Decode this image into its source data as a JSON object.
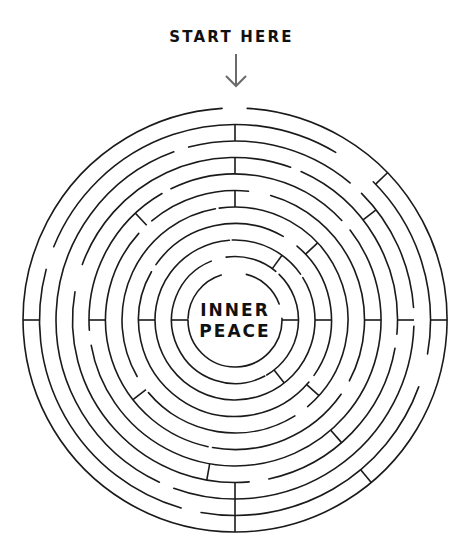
{
  "header": {
    "start_label": "START HERE",
    "arrow_icon": "arrow-down-icon"
  },
  "center": {
    "line1": "INNER",
    "line2": "PEACE"
  },
  "maze": {
    "center": [
      235,
      320
    ],
    "stroke_color": "#1a1a1a",
    "arrow_color": "#6b6b6b",
    "stroke_width": 1.6,
    "radii": [
      47,
      63.5,
      80,
      96.5,
      113,
      129.5,
      146,
      162.5,
      179,
      195.5,
      212
    ],
    "gaps": [
      [
        [
          -17,
          14
        ],
        [
          70,
          88
        ],
        [
          270,
          272
        ]
      ],
      [
        [
          -22,
          -8
        ],
        [
          40,
          44
        ],
        [
          150,
          152
        ]
      ],
      [
        [
          55,
          58
        ],
        [
          -4,
          -2
        ]
      ],
      [
        [
          30,
          40
        ],
        [
          125,
          130
        ],
        [
          -60,
          -55
        ]
      ],
      [
        [
          -10,
          -8
        ],
        [
          140,
          148
        ],
        [
          230,
          240
        ]
      ],
      [
        [
          6,
          16
        ],
        [
          118,
          125
        ],
        [
          -48,
          -40
        ],
        [
          190,
          192
        ]
      ],
      [
        [
          47,
          52
        ],
        [
          -30,
          -26
        ],
        [
          260,
          266
        ]
      ],
      [
        [
          20,
          24
        ],
        [
          95,
          100
        ],
        [
          -80,
          -70
        ],
        [
          168,
          175
        ]
      ],
      [
        [
          40,
          45
        ],
        [
          86,
          92
        ],
        [
          200,
          205
        ],
        [
          -20,
          -15
        ]
      ],
      [
        [
          31,
          45
        ],
        [
          100,
          110
        ],
        [
          190,
          196
        ],
        [
          -75,
          -68
        ]
      ],
      [
        [
          -3.5,
          3.3
        ]
      ]
    ],
    "walls": [
      [
        0,
        8,
        9
      ],
      [
        0,
        6,
        7
      ],
      [
        0,
        4,
        5
      ],
      [
        180,
        8,
        9
      ],
      [
        180,
        9,
        10
      ],
      [
        180,
        7,
        8
      ],
      [
        -90,
        0,
        1
      ],
      [
        -90,
        2,
        3
      ],
      [
        -90,
        5,
        6
      ],
      [
        -90,
        9,
        10
      ],
      [
        90,
        0,
        1
      ],
      [
        90,
        2,
        3
      ],
      [
        90,
        5,
        6
      ],
      [
        90,
        7,
        8
      ],
      [
        90,
        9,
        10
      ],
      [
        36,
        1,
        2
      ],
      [
        47,
        3,
        4
      ],
      [
        52,
        7,
        8
      ],
      [
        46,
        9,
        10
      ],
      [
        -43,
        5,
        6
      ],
      [
        132,
        3,
        4
      ],
      [
        142,
        1,
        2
      ],
      [
        139,
        6,
        7
      ],
      [
        140,
        9,
        10
      ],
      [
        -128,
        4,
        5
      ],
      [
        -170,
        6,
        7
      ]
    ]
  }
}
